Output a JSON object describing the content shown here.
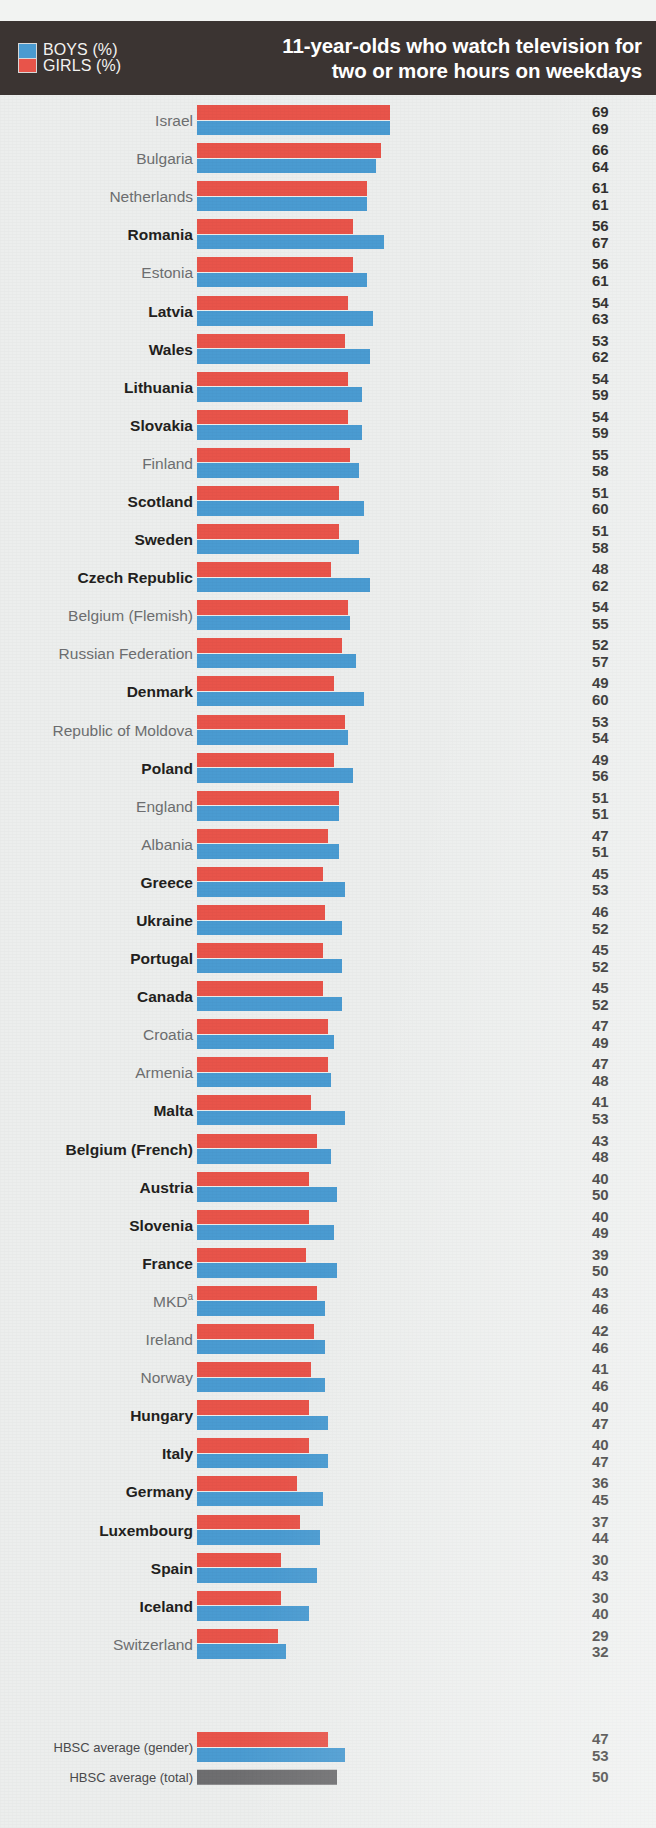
{
  "header": {
    "title_line1": "11-year-olds who watch television for",
    "title_line2": "two or more hours on weekdays",
    "legend": [
      {
        "label": "BOYS (%)",
        "color": "#4a9bd1",
        "key": "boys"
      },
      {
        "label": "GIRLS (%)",
        "color": "#e8544a",
        "key": "girls"
      }
    ]
  },
  "chart_data": {
    "type": "bar",
    "orientation": "horizontal",
    "title": "11-year-olds who watch television for two or more hours on weekdays",
    "xlabel": "",
    "ylabel": "",
    "xlim": [
      0,
      70
    ],
    "grid": false,
    "legend_position": "top-left",
    "series": [
      {
        "name": "GIRLS (%)",
        "color": "#e8544a",
        "values": [
          69,
          66,
          61,
          56,
          56,
          54,
          53,
          54,
          54,
          55,
          51,
          51,
          48,
          54,
          52,
          49,
          53,
          49,
          51,
          47,
          45,
          46,
          45,
          45,
          47,
          47,
          41,
          43,
          40,
          40,
          39,
          43,
          42,
          41,
          40,
          40,
          36,
          37,
          30,
          30,
          29
        ]
      },
      {
        "name": "BOYS (%)",
        "color": "#4a9bd1",
        "values": [
          69,
          64,
          61,
          67,
          61,
          63,
          62,
          59,
          59,
          58,
          60,
          58,
          62,
          55,
          57,
          60,
          54,
          56,
          51,
          51,
          53,
          52,
          52,
          52,
          49,
          48,
          53,
          48,
          50,
          49,
          50,
          46,
          46,
          46,
          47,
          47,
          45,
          44,
          43,
          40,
          32
        ]
      }
    ],
    "categories": [
      "Israel",
      "Bulgaria",
      "Netherlands",
      "Romania",
      "Estonia",
      "Latvia",
      "Wales",
      "Lithuania",
      "Slovakia",
      "Finland",
      "Scotland",
      "Sweden",
      "Czech Republic",
      "Belgium (Flemish)",
      "Russian Federation",
      "Denmark",
      "Republic of Moldova",
      "Poland",
      "England",
      "Albania",
      "Greece",
      "Ukraine",
      "Portugal",
      "Canada",
      "Croatia",
      "Armenia",
      "Malta",
      "Belgium (French)",
      "Austria",
      "Slovenia",
      "France",
      "MKD",
      "Ireland",
      "Norway",
      "Hungary",
      "Italy",
      "Germany",
      "Luxembourg",
      "Spain",
      "Iceland",
      "Switzerland"
    ],
    "averages": {
      "gender_label": "HBSC average (gender)",
      "gender_girls": 47,
      "gender_boys": 53,
      "total_label": "HBSC average (total)",
      "total_value": 50,
      "total_color": "#6e6e70"
    }
  },
  "rows": [
    {
      "name": "Israel",
      "bold": false,
      "girls": 69,
      "boys": 69
    },
    {
      "name": "Bulgaria",
      "bold": false,
      "girls": 66,
      "boys": 64
    },
    {
      "name": "Netherlands",
      "bold": false,
      "girls": 61,
      "boys": 61
    },
    {
      "name": "Romania",
      "bold": true,
      "girls": 56,
      "boys": 67
    },
    {
      "name": "Estonia",
      "bold": false,
      "girls": 56,
      "boys": 61
    },
    {
      "name": "Latvia",
      "bold": true,
      "girls": 54,
      "boys": 63
    },
    {
      "name": "Wales",
      "bold": true,
      "girls": 53,
      "boys": 62
    },
    {
      "name": "Lithuania",
      "bold": true,
      "girls": 54,
      "boys": 59
    },
    {
      "name": "Slovakia",
      "bold": true,
      "girls": 54,
      "boys": 59
    },
    {
      "name": "Finland",
      "bold": false,
      "girls": 55,
      "boys": 58
    },
    {
      "name": "Scotland",
      "bold": true,
      "girls": 51,
      "boys": 60
    },
    {
      "name": "Sweden",
      "bold": true,
      "girls": 51,
      "boys": 58
    },
    {
      "name": "Czech Republic",
      "bold": true,
      "girls": 48,
      "boys": 62
    },
    {
      "name": "Belgium (Flemish)",
      "bold": false,
      "girls": 54,
      "boys": 55
    },
    {
      "name": "Russian Federation",
      "bold": false,
      "girls": 52,
      "boys": 57
    },
    {
      "name": "Denmark",
      "bold": true,
      "girls": 49,
      "boys": 60
    },
    {
      "name": "Republic of Moldova",
      "bold": false,
      "girls": 53,
      "boys": 54
    },
    {
      "name": "Poland",
      "bold": true,
      "girls": 49,
      "boys": 56
    },
    {
      "name": "England",
      "bold": false,
      "girls": 51,
      "boys": 51
    },
    {
      "name": "Albania",
      "bold": false,
      "girls": 47,
      "boys": 51
    },
    {
      "name": "Greece",
      "bold": true,
      "girls": 45,
      "boys": 53
    },
    {
      "name": "Ukraine",
      "bold": true,
      "girls": 46,
      "boys": 52
    },
    {
      "name": "Portugal",
      "bold": true,
      "girls": 45,
      "boys": 52
    },
    {
      "name": "Canada",
      "bold": true,
      "girls": 45,
      "boys": 52
    },
    {
      "name": "Croatia",
      "bold": false,
      "girls": 47,
      "boys": 49
    },
    {
      "name": "Armenia",
      "bold": false,
      "girls": 47,
      "boys": 48
    },
    {
      "name": "Malta",
      "bold": true,
      "girls": 41,
      "boys": 53
    },
    {
      "name": "Belgium (French)",
      "bold": true,
      "girls": 43,
      "boys": 48
    },
    {
      "name": "Austria",
      "bold": true,
      "girls": 40,
      "boys": 50
    },
    {
      "name": "Slovenia",
      "bold": true,
      "girls": 40,
      "boys": 49
    },
    {
      "name": "France",
      "bold": true,
      "girls": 39,
      "boys": 50
    },
    {
      "name": "MKD",
      "bold": false,
      "girls": 43,
      "boys": 46,
      "sup": "a"
    },
    {
      "name": "Ireland",
      "bold": false,
      "girls": 42,
      "boys": 46
    },
    {
      "name": "Norway",
      "bold": false,
      "girls": 41,
      "boys": 46
    },
    {
      "name": "Hungary",
      "bold": true,
      "girls": 40,
      "boys": 47
    },
    {
      "name": "Italy",
      "bold": true,
      "girls": 40,
      "boys": 47
    },
    {
      "name": "Germany",
      "bold": true,
      "girls": 36,
      "boys": 45
    },
    {
      "name": "Luxembourg",
      "bold": true,
      "girls": 37,
      "boys": 44
    },
    {
      "name": "Spain",
      "bold": true,
      "girls": 30,
      "boys": 43
    },
    {
      "name": "Iceland",
      "bold": true,
      "girls": 30,
      "boys": 40
    },
    {
      "name": "Switzerland",
      "bold": false,
      "girls": 29,
      "boys": 32
    }
  ],
  "averages": {
    "gender_label": "HBSC average (gender)",
    "gender_girls": 47,
    "gender_boys": 53,
    "total_label": "HBSC average (total)",
    "total_value": 50
  }
}
